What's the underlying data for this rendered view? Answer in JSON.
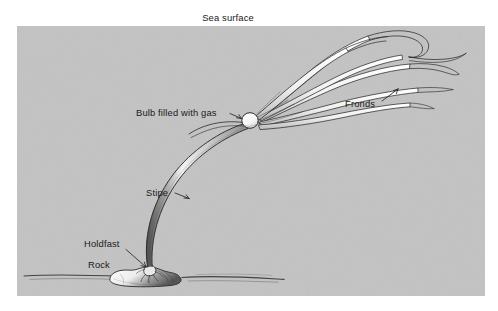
{
  "figure": {
    "name": "bull-kelp-anatomy-diagram",
    "panel": {
      "background_color": "#c3c3c3",
      "x": 17,
      "y": 26,
      "width": 468,
      "height": 270
    },
    "page_background_color": "#ffffff",
    "ink_color": "#2b2b2b",
    "label_color": "#1a1a1a"
  },
  "title": {
    "text": "Sea surface"
  },
  "labels": [
    {
      "id": "bulb",
      "text": "Bulb filled with gas"
    },
    {
      "id": "fronds",
      "text": "Fronds"
    },
    {
      "id": "stipe",
      "text": "Stipe"
    },
    {
      "id": "holdfast",
      "text": "Holdfast"
    },
    {
      "id": "rock",
      "text": "Rock"
    }
  ],
  "parts": {
    "bulb": {
      "label": "Bulb filled with gas",
      "fill_color": "#fbfbfb"
    },
    "fronds": {
      "label": "Fronds",
      "count": 6
    },
    "stipe": {
      "label": "Stipe"
    },
    "holdfast": {
      "label": "Holdfast"
    },
    "rock": {
      "label": "Rock"
    },
    "seafloor": {
      "label": "seafloor"
    }
  }
}
